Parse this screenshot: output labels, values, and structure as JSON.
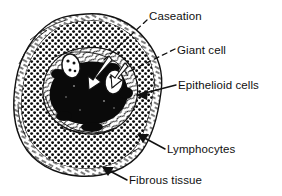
{
  "figure": {
    "kind": "histology-line-drawing",
    "background_color": "#ffffff",
    "ink_color": "#101010",
    "labels": [
      {
        "id": "caseation",
        "text": "Caseation",
        "leader": "dashed-line",
        "points_to": "dark necrotic centre"
      },
      {
        "id": "giant_cell",
        "text": "Giant cell",
        "leader": "dashed-line",
        "points_to": "white oval multinucleate cell"
      },
      {
        "id": "epithelioid_cells",
        "text": "Epithelioid cells",
        "leader": "solid-arrow",
        "points_to": "pale cell band around centre"
      },
      {
        "id": "lymphocytes",
        "text": "Lymphocytes",
        "leader": "solid-arrow",
        "points_to": "dense stippled zone"
      },
      {
        "id": "fibrous_tissue",
        "text": "Fibrous tissue",
        "leader": "solid-arrow",
        "points_to": "outer fibrous rim"
      }
    ],
    "regions": {
      "caseation_label": "Caseation",
      "giant_cell_label": "Giant cell",
      "epithelioid_label": "Epithelioid cells",
      "lymphocytes_label": "Lymphocytes",
      "fibrous_label": "Fibrous tissue"
    }
  }
}
